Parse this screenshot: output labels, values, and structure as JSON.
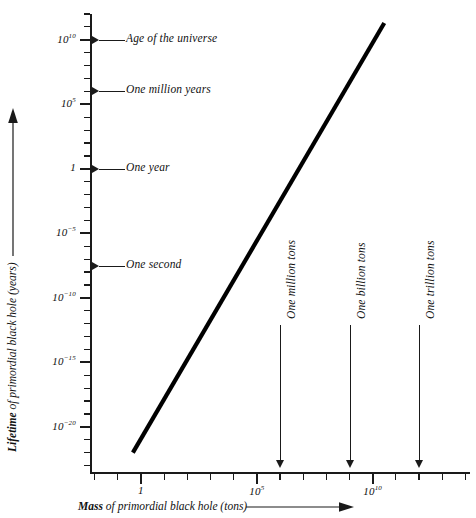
{
  "chart_data": {
    "type": "line",
    "title": "",
    "xlabel": "Mass of primordial black hole (tons)",
    "ylabel": "Lifetime of primordial black hole (years)",
    "xscale": "log",
    "yscale": "log",
    "xlim": [
      -2.2,
      14.2
    ],
    "ylim": [
      -23.5,
      12.0
    ],
    "grid": false,
    "legend": null,
    "x_tick_labels": [
      "1",
      "10⁵",
      "10¹⁰"
    ],
    "x_tick_exponents": [
      0,
      5,
      10
    ],
    "y_tick_labels": [
      "10¹⁰",
      "10⁵",
      "1",
      "10⁻⁵",
      "10⁻¹⁰",
      "10⁻¹⁵",
      "10⁻²⁰"
    ],
    "y_tick_exponents": [
      10,
      5,
      0,
      -5,
      -10,
      -15,
      -20
    ],
    "series": [
      {
        "name": "Hawking evaporation lifetime",
        "x": [
          -0.35,
          10.5
        ],
        "y": [
          -22.0,
          11.3
        ]
      }
    ],
    "y_annotations": [
      {
        "label": "Age of the universe",
        "value_exponent": 10
      },
      {
        "label": "One million years",
        "value_exponent": 6
      },
      {
        "label": "One year",
        "value_exponent": 0
      },
      {
        "label": "One second",
        "value_exponent": -7.5
      }
    ],
    "x_annotations": [
      {
        "label": "One million tons",
        "value_exponent": 6
      },
      {
        "label": "One billion tons",
        "value_exponent": 9
      },
      {
        "label": "One trillion tons",
        "value_exponent": 12
      }
    ]
  },
  "axes": {
    "x_title_bold": "Mass",
    "x_title_rest": " of primordial black hole (tons)",
    "y_title_bold": "Lifetime",
    "y_title_rest": " of primordial black hole (years)"
  },
  "colors": {
    "ink": "#1a1a1a",
    "curve": "#000000",
    "background": "#ffffff"
  }
}
